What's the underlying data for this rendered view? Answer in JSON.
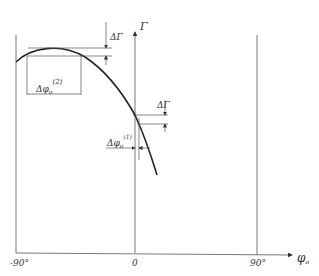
{
  "diagram": {
    "y_axis_label": "Γ",
    "x_axis_label": "φ",
    "x_axis_label_sub": "o",
    "x_ticks": [
      "-90°",
      "0",
      "90°"
    ],
    "annotations": {
      "delta_gamma_top": "ΔΓ",
      "delta_gamma_right": "ΔΓ",
      "delta_phi_2": "Δφ",
      "delta_phi_2_sub": "o",
      "delta_phi_2_sup": "(2)",
      "delta_phi_1": "Δφ",
      "delta_phi_1_sub": "o",
      "delta_phi_1_sup": "(1)"
    },
    "colors": {
      "line": "#222222",
      "thin_line": "#555555",
      "background": "#ffffff"
    }
  }
}
